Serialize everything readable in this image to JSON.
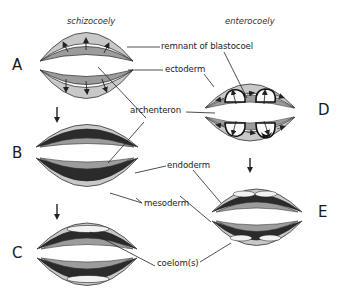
{
  "titles": {
    "left": "schizocoely",
    "right": "enterocoely"
  },
  "stages": {
    "A": "A",
    "B": "B",
    "C": "C",
    "D": "D",
    "E": "E"
  },
  "labels": {
    "remnant": "remnant of blastocoel",
    "ectoderm": "ectoderm",
    "archenteron": "archenteron",
    "endoderm": "endoderm",
    "mesoderm": "mesoderm",
    "coelom": "coelom(s)"
  },
  "colors": {
    "ectoderm": "#c4c4c4",
    "endoderm": "#9a9a9a",
    "mesoderm": "#2a2a2a",
    "coelom": "#f4f4f4",
    "outline": "#333333",
    "background": "#ffffff"
  }
}
